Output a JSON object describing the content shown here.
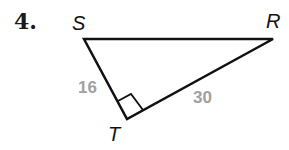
{
  "problem": {
    "number": "4."
  },
  "diagram": {
    "type": "right-triangle",
    "stroke_color": "#111111",
    "label_color": "#a0a0a0",
    "vertices": [
      {
        "name": "S",
        "label": "S"
      },
      {
        "name": "R",
        "label": "R"
      },
      {
        "name": "T",
        "label": "T"
      }
    ],
    "right_angle_at": "T",
    "sides": [
      {
        "from": "S",
        "to": "T",
        "length": "16"
      },
      {
        "from": "T",
        "to": "R",
        "length": "30"
      },
      {
        "from": "S",
        "to": "R",
        "length": ""
      }
    ]
  }
}
